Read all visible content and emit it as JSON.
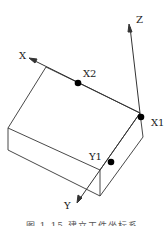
{
  "diagram": {
    "labels": {
      "x_axis": "X",
      "y_axis": "Y",
      "z_axis": "Z",
      "x1": "X1",
      "x2": "X2",
      "y1": "Y1"
    },
    "caption": "图 1-15  建立工件坐标系",
    "colors": {
      "line": "#333333",
      "point": "#000000",
      "background": "#ffffff"
    }
  }
}
